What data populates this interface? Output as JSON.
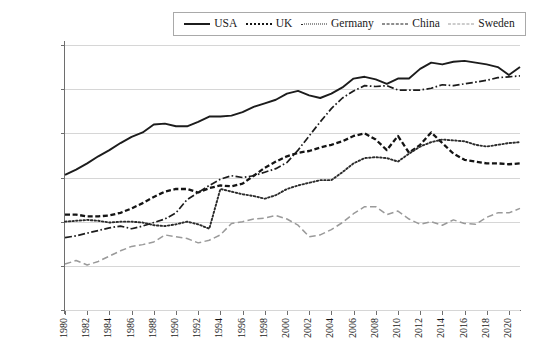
{
  "legend": {
    "position": "top-center",
    "items": [
      {
        "label": "USA",
        "style": "solid",
        "color": "#1c1c1c",
        "icon": "line-solid-icon"
      },
      {
        "label": "UK",
        "style": "dotted",
        "color": "#141414",
        "icon": "line-dotted-icon"
      },
      {
        "label": "Germany",
        "style": "fine-dotted",
        "color": "#2b2b2b",
        "icon": "line-fine-dotted-icon"
      },
      {
        "label": "China",
        "style": "dash-dot",
        "color": "#1c1c1c",
        "icon": "line-dash-dot-icon"
      },
      {
        "label": "Sweden",
        "style": "dashed",
        "color": "#9a9a9a",
        "icon": "line-dashed-icon"
      }
    ]
  },
  "axes": {
    "ylabel": "Pre-tax Gini coefficient, 1980–2021",
    "xlabel": "",
    "yticks": [
      "0.6",
      "0.55",
      "0.5",
      "0.45",
      "0.4",
      "0.35",
      "0.3"
    ],
    "xticks": [
      "1980",
      "1982",
      "1984",
      "1986",
      "1988",
      "1990",
      "1992",
      "1994",
      "1996",
      "1998",
      "2000",
      "2002",
      "2004",
      "2006",
      "2008",
      "2010",
      "2012",
      "2014",
      "2016",
      "2018",
      "2020"
    ]
  },
  "chart_data": {
    "type": "line",
    "title": "",
    "xlabel": "",
    "ylabel": "Pre-tax Gini coefficient, 1980–2021",
    "xlim": [
      1980,
      2021
    ],
    "ylim": [
      0.3,
      0.6
    ],
    "grid": true,
    "legend_position": "top-center",
    "x": [
      1980,
      1981,
      1982,
      1983,
      1984,
      1985,
      1986,
      1987,
      1988,
      1989,
      1990,
      1991,
      1992,
      1993,
      1994,
      1995,
      1996,
      1997,
      1998,
      1999,
      2000,
      2001,
      2002,
      2003,
      2004,
      2005,
      2006,
      2007,
      2008,
      2009,
      2010,
      2011,
      2012,
      2013,
      2014,
      2015,
      2016,
      2017,
      2018,
      2019,
      2020,
      2021
    ],
    "series": [
      {
        "name": "USA",
        "color": "#1c1c1c",
        "style": "solid",
        "values": [
          0.453,
          0.459,
          0.466,
          0.474,
          0.481,
          0.489,
          0.496,
          0.501,
          0.51,
          0.511,
          0.508,
          0.508,
          0.513,
          0.519,
          0.519,
          0.52,
          0.524,
          0.53,
          0.534,
          0.538,
          0.545,
          0.548,
          0.543,
          0.54,
          0.545,
          0.552,
          0.562,
          0.564,
          0.561,
          0.556,
          0.562,
          0.562,
          0.573,
          0.58,
          0.578,
          0.581,
          0.582,
          0.58,
          0.578,
          0.575,
          0.566,
          0.575
        ]
      },
      {
        "name": "UK",
        "color": "#141414",
        "style": "dotted",
        "values": [
          0.408,
          0.408,
          0.406,
          0.406,
          0.407,
          0.41,
          0.415,
          0.421,
          0.428,
          0.434,
          0.437,
          0.437,
          0.433,
          0.438,
          0.441,
          0.44,
          0.443,
          0.452,
          0.461,
          0.468,
          0.474,
          0.478,
          0.48,
          0.484,
          0.487,
          0.491,
          0.497,
          0.5,
          0.493,
          0.481,
          0.497,
          0.478,
          0.487,
          0.501,
          0.489,
          0.477,
          0.47,
          0.468,
          0.466,
          0.466,
          0.465,
          0.466
        ]
      },
      {
        "name": "Germany",
        "color": "#2b2b2b",
        "style": "fine-dotted",
        "values": [
          0.4,
          0.401,
          0.402,
          0.401,
          0.399,
          0.4,
          0.4,
          0.399,
          0.396,
          0.395,
          0.397,
          0.4,
          0.397,
          0.392,
          0.437,
          0.434,
          0.431,
          0.429,
          0.426,
          0.43,
          0.437,
          0.441,
          0.444,
          0.447,
          0.447,
          0.456,
          0.466,
          0.472,
          0.473,
          0.472,
          0.468,
          0.477,
          0.485,
          0.49,
          0.493,
          0.492,
          0.491,
          0.487,
          0.485,
          0.487,
          0.489,
          0.49
        ]
      },
      {
        "name": "China",
        "color": "#1c1c1c",
        "style": "dash-dot",
        "values": [
          0.382,
          0.384,
          0.387,
          0.39,
          0.393,
          0.395,
          0.392,
          0.395,
          0.399,
          0.403,
          0.41,
          0.425,
          0.433,
          0.441,
          0.448,
          0.452,
          0.45,
          0.452,
          0.456,
          0.46,
          0.467,
          0.481,
          0.497,
          0.513,
          0.528,
          0.54,
          0.548,
          0.554,
          0.553,
          0.554,
          0.549,
          0.549,
          0.549,
          0.551,
          0.555,
          0.554,
          0.556,
          0.558,
          0.56,
          0.563,
          0.564,
          0.565
        ]
      },
      {
        "name": "Sweden",
        "color": "#9a9a9a",
        "style": "dashed",
        "values": [
          0.352,
          0.356,
          0.351,
          0.355,
          0.361,
          0.367,
          0.372,
          0.374,
          0.377,
          0.385,
          0.383,
          0.381,
          0.376,
          0.379,
          0.385,
          0.398,
          0.4,
          0.403,
          0.404,
          0.407,
          0.403,
          0.396,
          0.383,
          0.385,
          0.391,
          0.399,
          0.409,
          0.417,
          0.417,
          0.408,
          0.412,
          0.403,
          0.397,
          0.4,
          0.396,
          0.402,
          0.398,
          0.397,
          0.405,
          0.41,
          0.41,
          0.415
        ]
      }
    ]
  }
}
